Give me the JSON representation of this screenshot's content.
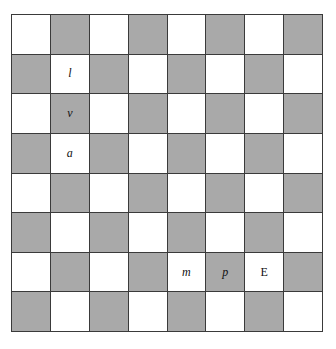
{
  "board": {
    "rows": 8,
    "cols": 8,
    "colors": {
      "light": "#ffffff",
      "dark": "#a9a9a9",
      "grid": "#3a3a3a"
    },
    "first_cell": "light",
    "labels": [
      {
        "row": 1,
        "col": 1,
        "text": "l",
        "italic": true
      },
      {
        "row": 2,
        "col": 1,
        "text": "v",
        "italic": true
      },
      {
        "row": 3,
        "col": 1,
        "text": "a",
        "italic": true
      },
      {
        "row": 6,
        "col": 4,
        "text": "m",
        "italic": true
      },
      {
        "row": 6,
        "col": 5,
        "text": "p",
        "italic": true
      },
      {
        "row": 6,
        "col": 6,
        "text": "E",
        "italic": false
      }
    ]
  }
}
